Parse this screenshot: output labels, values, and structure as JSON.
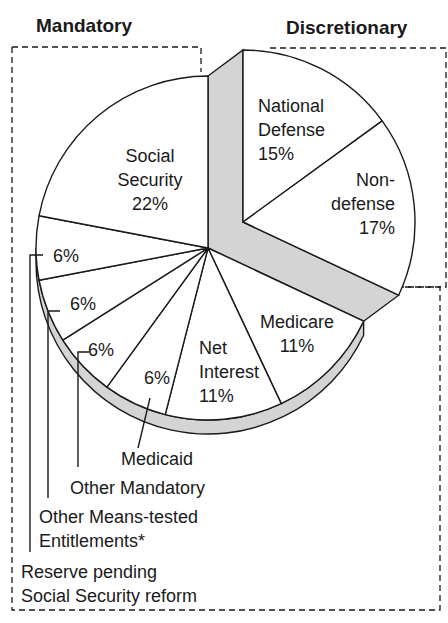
{
  "chart_data": {
    "type": "pie",
    "title": "",
    "groups": [
      {
        "name": "Mandatory",
        "members": [
          "Social Security",
          "Reserve pending Social Security reform",
          "Other Means-tested Entitlements*",
          "Other Mandatory",
          "Medicaid",
          "Net Interest",
          "Medicare"
        ]
      },
      {
        "name": "Discretionary",
        "members": [
          "National Defense",
          "Non-defense"
        ]
      }
    ],
    "slices": [
      {
        "label": "National Defense",
        "lines": [
          "National",
          "Defense",
          "15%"
        ],
        "value": 15,
        "group": "Discretionary",
        "exploded": true
      },
      {
        "label": "Non-defense",
        "lines": [
          "Non-",
          "defense",
          "17%"
        ],
        "value": 17,
        "group": "Discretionary",
        "exploded": true
      },
      {
        "label": "Medicare",
        "lines": [
          "Medicare",
          "11%"
        ],
        "value": 11,
        "group": "Mandatory"
      },
      {
        "label": "Net Interest",
        "lines": [
          "Net",
          "Interest",
          "11%"
        ],
        "value": 11,
        "group": "Mandatory"
      },
      {
        "label": "Medicaid",
        "lines": [
          "6%"
        ],
        "callout": [
          "Medicaid"
        ],
        "value": 6,
        "group": "Mandatory"
      },
      {
        "label": "Other Mandatory",
        "lines": [
          "6%"
        ],
        "callout": [
          "Other Mandatory"
        ],
        "value": 6,
        "group": "Mandatory"
      },
      {
        "label": "Other Means-tested Entitlements*",
        "lines": [
          "6%"
        ],
        "callout": [
          "Other Means-tested",
          "Entitlements*"
        ],
        "value": 6,
        "group": "Mandatory"
      },
      {
        "label": "Reserve pending Social Security reform",
        "lines": [
          "6%"
        ],
        "callout": [
          "Reserve pending",
          "Social Security reform"
        ],
        "value": 6,
        "group": "Mandatory"
      },
      {
        "label": "Social Security",
        "lines": [
          "Social",
          "Security",
          "22%"
        ],
        "value": 22,
        "group": "Mandatory"
      }
    ],
    "units": "percent",
    "colors": {
      "slice": "#ffffff",
      "edge": "#1a1a1a",
      "rim": "#d4d4d4"
    }
  }
}
